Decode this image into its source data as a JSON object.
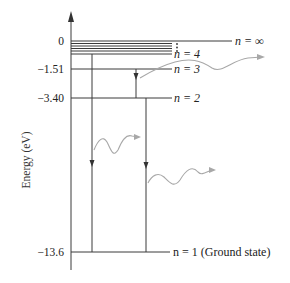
{
  "diagram": {
    "type": "energy-level-diagram",
    "axis_title": "Energy (eV)",
    "levels": [
      {
        "n": "∞",
        "energy_label": "0",
        "label": "n =  ∞",
        "y": 41,
        "x_end": 232
      },
      {
        "n": "4",
        "energy_label": "",
        "label": "n = 4",
        "y": 54,
        "x_end": 172
      },
      {
        "n": "3",
        "energy_label": "−1.51",
        "label": "n = 3",
        "y": 69,
        "x_end": 172
      },
      {
        "n": "2",
        "energy_label": "−3.40",
        "label": "n = 2",
        "y": 98,
        "x_end": 172
      },
      {
        "n": "1",
        "energy_label": "−13.6",
        "label": "n = 1 (Ground state)",
        "y": 252,
        "x_end": 170
      }
    ],
    "ellipsis": "⋮",
    "transitions": [
      {
        "from": "4",
        "to": "1",
        "x": 92
      },
      {
        "from": "3",
        "to": "2",
        "x": 136
      },
      {
        "from": "2",
        "to": "1",
        "x": 146
      }
    ],
    "photons": [
      {
        "emitted_by": "3→2"
      },
      {
        "emitted_by": "4→1"
      },
      {
        "emitted_by": "2→1"
      }
    ],
    "colors": {
      "lines": "#3a3a3a",
      "photon": "#a8a8a8",
      "text": "#222222"
    }
  }
}
